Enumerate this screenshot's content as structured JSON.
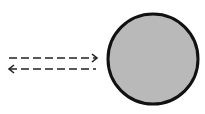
{
  "diagram": {
    "circle": {
      "cx": 153,
      "cy": 59,
      "r": 45,
      "fill": "#b9b9b9",
      "stroke": "#111111",
      "stroke_width": 3
    },
    "arrows": [
      {
        "name": "incoming-arrow",
        "direction": "right",
        "y": 58,
        "x1": 9,
        "x2": 97,
        "dash": "8 4"
      },
      {
        "name": "outgoing-arrow",
        "direction": "left",
        "y": 69,
        "x1": 9,
        "x2": 96,
        "dash": "8 4"
      }
    ],
    "arrow_color": "#222222"
  }
}
